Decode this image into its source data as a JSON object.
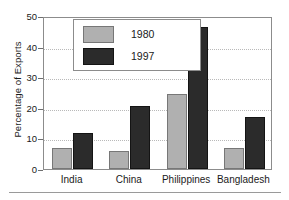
{
  "chart_data": {
    "type": "bar",
    "title": "",
    "xlabel": "",
    "ylabel": "Percentage of Exports",
    "ylim": [
      0,
      50
    ],
    "ytick_values": [
      0,
      10,
      20,
      30,
      40,
      50
    ],
    "ytick_labels": [
      "0",
      "10",
      "20",
      "30",
      "40",
      "50"
    ],
    "grid": "horizontal-dotted",
    "legend_position": "upper-left-inside",
    "categories": [
      "India",
      "China",
      "Philippines",
      "Bangladesh"
    ],
    "series": [
      {
        "name": "1980",
        "color": "#b0b0b0",
        "values": [
          7,
          6,
          24.5,
          7
        ]
      },
      {
        "name": "1997",
        "color": "#2b2b2b",
        "values": [
          11.8,
          20.5,
          46.5,
          17
        ]
      }
    ]
  },
  "axis": {
    "y_title": "Percentage of Exports"
  },
  "legend": {
    "entries": [
      {
        "label": "1980"
      },
      {
        "label": "1997"
      }
    ]
  }
}
